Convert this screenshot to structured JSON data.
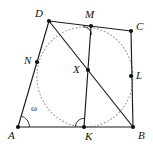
{
  "figure": {
    "type": "geometry-diagram",
    "canvas": {
      "width": 153,
      "height": 151
    },
    "colors": {
      "stroke": "#1a1a1a",
      "circle": "#8a8a8a",
      "point_fill": "#111111",
      "background": "#ffffff"
    },
    "points": [
      {
        "id": "A",
        "label": "A",
        "x": 18,
        "y": 127,
        "label_x": 8,
        "label_y": 130,
        "kind": "vertex"
      },
      {
        "id": "B",
        "label": "B",
        "x": 133,
        "y": 127,
        "label_x": 138,
        "label_y": 130,
        "kind": "vertex"
      },
      {
        "id": "C",
        "label": "C",
        "x": 131,
        "y": 31,
        "label_x": 136,
        "label_y": 21,
        "kind": "vertex"
      },
      {
        "id": "D",
        "label": "D",
        "x": 49,
        "y": 21,
        "label_x": 35,
        "label_y": 8,
        "kind": "vertex"
      },
      {
        "id": "M",
        "label": "M",
        "x": 91,
        "y": 26,
        "label_x": 85,
        "label_y": 9,
        "kind": "tangency"
      },
      {
        "id": "N",
        "label": "N",
        "x": 37,
        "y": 62,
        "label_x": 24,
        "label_y": 55,
        "kind": "tangency"
      },
      {
        "id": "K",
        "label": "K",
        "x": 84,
        "y": 127,
        "label_x": 85,
        "label_y": 131,
        "kind": "tangency"
      },
      {
        "id": "L",
        "label": "L",
        "x": 131,
        "y": 76,
        "label_x": 136,
        "label_y": 70,
        "kind": "tangency"
      },
      {
        "id": "X",
        "label": "X",
        "x": 88,
        "y": 70,
        "label_x": 73,
        "label_y": 64,
        "kind": "intersection"
      }
    ],
    "segments": [
      {
        "id": "AB",
        "from": "A",
        "to": "B",
        "style": "solid"
      },
      {
        "id": "BC",
        "from": "B",
        "to": "C",
        "style": "solid"
      },
      {
        "id": "CD",
        "from": "C",
        "to": "D",
        "style": "solid"
      },
      {
        "id": "DA",
        "from": "D",
        "to": "A",
        "style": "solid"
      },
      {
        "id": "DB",
        "from": "D",
        "to": "B",
        "style": "solid"
      },
      {
        "id": "MK",
        "from": "M",
        "to": "K",
        "style": "solid"
      }
    ],
    "circle": {
      "id": "omega",
      "label": "ω",
      "cx": 85,
      "cy": 77,
      "rx": 48,
      "ry": 50,
      "rotation": -6,
      "style": "dotted",
      "label_x": 31,
      "label_y": 104,
      "passes_through": [
        "N",
        "M",
        "L",
        "K"
      ]
    },
    "angle_marks": [
      {
        "id": "angle-at-A",
        "at": "A",
        "type": "arc",
        "label": "ω"
      },
      {
        "id": "angle-at-M",
        "at": "M",
        "type": "arc"
      },
      {
        "id": "angle-at-K",
        "at": "K",
        "type": "arc"
      }
    ]
  }
}
